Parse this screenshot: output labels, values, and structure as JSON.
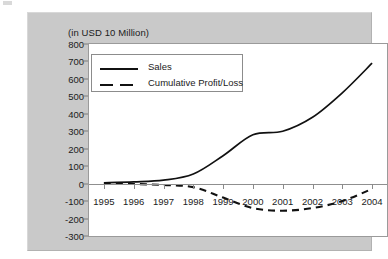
{
  "chart_data": {
    "type": "line",
    "title": "(in USD 10 Million)",
    "xlabel": "",
    "ylabel": "",
    "categories": [
      "1995",
      "1996",
      "1997",
      "1998",
      "1999",
      "2000",
      "2001",
      "2002",
      "2003",
      "2004"
    ],
    "series": [
      {
        "name": "Sales",
        "style": "solid",
        "color": "#111111",
        "values": [
          5,
          10,
          20,
          55,
          160,
          280,
          300,
          380,
          520,
          690
        ]
      },
      {
        "name": "Cumulative Profit/Loss",
        "style": "dashed",
        "color": "#111111",
        "values": [
          0,
          -2,
          -8,
          -20,
          -80,
          -140,
          -155,
          -140,
          -100,
          -30
        ]
      }
    ],
    "ylim": [
      -300,
      800
    ],
    "yticks": [
      800,
      700,
      600,
      500,
      400,
      300,
      200,
      100,
      0,
      -100,
      -200,
      -300
    ],
    "ytick_labels": [
      "800",
      "700",
      "600",
      "500",
      "400",
      "300",
      "200",
      "100",
      "0",
      "-100",
      "-200",
      "-300"
    ],
    "grid": false,
    "legend_position": "upper-left",
    "zero_line": true
  },
  "legend": {
    "items": [
      {
        "label": "Sales",
        "style": "solid"
      },
      {
        "label": "Cumulative Profit/Loss",
        "style": "dashed"
      }
    ]
  },
  "colors": {
    "panel_background": "#c9c9c9",
    "plot_background": "#ffffff",
    "line": "#111111",
    "axis": "#8a8a8a",
    "text": "#1b1b1b"
  }
}
